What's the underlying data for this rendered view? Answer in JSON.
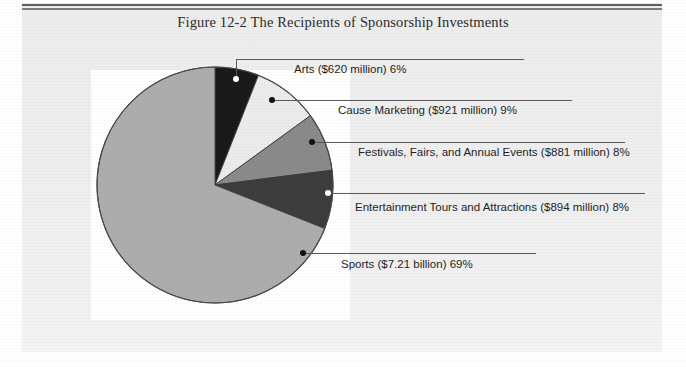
{
  "figure": {
    "title": "Figure 12-2  The Recipients of Sponsorship Investments"
  },
  "chart_data": {
    "type": "pie",
    "title": "Figure 12-2  The Recipients of Sponsorship Investments",
    "xlabel": "",
    "ylabel": "",
    "legend_position": "callout-labels-right",
    "grid": false,
    "start_angle_deg": 0,
    "direction": "clockwise",
    "categories": [
      "Arts",
      "Cause Marketing",
      "Festivals, Fairs, and Annual Events",
      "Entertainment Tours and Attractions",
      "Sports"
    ],
    "values": [
      6,
      9,
      8,
      8,
      69
    ],
    "value_unit": "percent",
    "amounts": [
      "$620 million",
      "$921 million",
      "$881 million",
      "$894 million",
      "$7.21 billion"
    ],
    "amounts_usd_millions": [
      620,
      921,
      881,
      894,
      7210
    ],
    "colors": [
      "#1a1a1a",
      "#ececec",
      "#8a8a8a",
      "#3d3d3d",
      "#adadad"
    ],
    "slices": [
      {
        "name": "Arts",
        "label": "Arts ($620 million) 6%",
        "percent": 6,
        "amount": "$620 million",
        "color": "#1a1a1a",
        "marker_color": "#ffffff"
      },
      {
        "name": "Cause Marketing",
        "label": "Cause Marketing ($921 million) 9%",
        "percent": 9,
        "amount": "$921 million",
        "color": "#ececec",
        "marker_color": "#111111"
      },
      {
        "name": "Festivals, Fairs, and Annual Events",
        "label": "Festivals, Fairs, and Annual Events ($881 million) 8%",
        "percent": 8,
        "amount": "$881 million",
        "color": "#8a8a8a",
        "marker_color": "#111111"
      },
      {
        "name": "Entertainment Tours and Attractions",
        "label": "Entertainment Tours and Attractions ($894 million) 8%",
        "percent": 8,
        "amount": "$894 million",
        "color": "#3d3d3d",
        "marker_color": "#ffffff"
      },
      {
        "name": "Sports",
        "label": "Sports ($7.21 billion) 69%",
        "percent": 69,
        "amount": "$7.21 billion",
        "color": "#adadad",
        "marker_color": "#111111"
      }
    ]
  }
}
